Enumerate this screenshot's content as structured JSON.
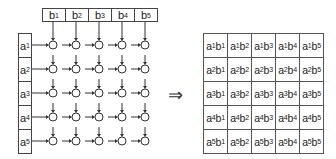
{
  "left_diagram": {
    "b_labels": [
      {
        "base": "b",
        "sub": "1"
      },
      {
        "base": "b",
        "sub": "2"
      },
      {
        "base": "b",
        "sub": "3"
      },
      {
        "base": "b",
        "sub": "4"
      },
      {
        "base": "b",
        "sub": "5"
      }
    ],
    "a_labels": [
      {
        "base": "a",
        "sub": "1"
      },
      {
        "base": "a",
        "sub": "2"
      },
      {
        "base": "a",
        "sub": "3"
      },
      {
        "base": "a",
        "sub": "4"
      },
      {
        "base": "a",
        "sub": "5"
      }
    ]
  },
  "transform_symbol": "⇒",
  "result_grid": {
    "rows": [
      [
        {
          "a": "1",
          "b": "1"
        },
        {
          "a": "1",
          "b": "2"
        },
        {
          "a": "1",
          "b": "3"
        },
        {
          "a": "1",
          "b": "4"
        },
        {
          "a": "1",
          "b": "5"
        }
      ],
      [
        {
          "a": "2",
          "b": "1"
        },
        {
          "a": "2",
          "b": "2"
        },
        {
          "a": "2",
          "b": "3"
        },
        {
          "a": "2",
          "b": "4"
        },
        {
          "a": "2",
          "b": "5"
        }
      ],
      [
        {
          "a": "3",
          "b": "1"
        },
        {
          "a": "3",
          "b": "2"
        },
        {
          "a": "3",
          "b": "3"
        },
        {
          "a": "3",
          "b": "4"
        },
        {
          "a": "3",
          "b": "5"
        }
      ],
      [
        {
          "a": "4",
          "b": "1"
        },
        {
          "a": "4",
          "b": "2"
        },
        {
          "a": "4",
          "b": "3"
        },
        {
          "a": "4",
          "b": "4"
        },
        {
          "a": "4",
          "b": "5"
        }
      ],
      [
        {
          "a": "5",
          "b": "1"
        },
        {
          "a": "5",
          "b": "2"
        },
        {
          "a": "5",
          "b": "3"
        },
        {
          "a": "5",
          "b": "4"
        },
        {
          "a": "5",
          "b": "5"
        }
      ]
    ]
  }
}
